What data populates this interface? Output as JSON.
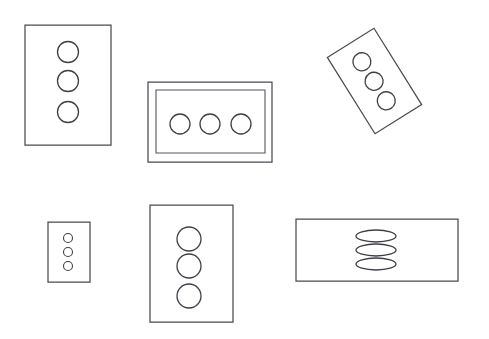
{
  "figure": {
    "background_color": "#ffffff",
    "stroke_color": "#4a4a52",
    "width": 489,
    "height": 339,
    "shape_count": 6,
    "marker_total": 18
  },
  "shapes": [
    {
      "id": "card-top-left",
      "name": "upright-rectangle-three-circles",
      "type": "rectangle",
      "orientation": "portrait",
      "rotation_deg": 0,
      "x": 25,
      "y": 25,
      "width": 86,
      "height": 120,
      "nested": false,
      "markers": {
        "shape": "circle",
        "count": 3,
        "arrangement": "vertical",
        "radius": 10.5,
        "positions": [
          {
            "cx": 68,
            "cy": 52
          },
          {
            "cx": 68,
            "cy": 81
          },
          {
            "cx": 68,
            "cy": 112
          }
        ]
      }
    },
    {
      "id": "card-top-center",
      "name": "nested-rectangle-three-circles",
      "type": "rectangle",
      "orientation": "landscape",
      "rotation_deg": 0,
      "x": 148,
      "y": 82,
      "width": 124,
      "height": 80,
      "nested": true,
      "inner": {
        "x": 156,
        "y": 90,
        "width": 109,
        "height": 63
      },
      "markers": {
        "shape": "circle",
        "count": 3,
        "arrangement": "horizontal",
        "radius": 10,
        "positions": [
          {
            "cx": 180,
            "cy": 124
          },
          {
            "cx": 210,
            "cy": 124
          },
          {
            "cx": 241,
            "cy": 124
          }
        ]
      }
    },
    {
      "id": "card-top-right",
      "name": "rotated-rectangle-three-circles",
      "type": "rectangle",
      "orientation": "portrait",
      "rotation_deg": -32,
      "x": 347,
      "y": 36,
      "width": 55,
      "height": 90,
      "nested": false,
      "markers": {
        "shape": "circle",
        "count": 3,
        "arrangement": "vertical",
        "radius": 9,
        "positions": [
          {
            "cx": 374,
            "cy": 58
          },
          {
            "cx": 374,
            "cy": 81
          },
          {
            "cx": 374,
            "cy": 104
          }
        ]
      }
    },
    {
      "id": "card-bottom-left",
      "name": "small-rectangle-three-circles",
      "type": "rectangle",
      "orientation": "portrait",
      "rotation_deg": 0,
      "x": 48,
      "y": 222,
      "width": 42,
      "height": 60,
      "nested": false,
      "markers": {
        "shape": "circle",
        "count": 3,
        "arrangement": "vertical",
        "radius": 4.5,
        "positions": [
          {
            "cx": 68,
            "cy": 238
          },
          {
            "cx": 68,
            "cy": 252
          },
          {
            "cx": 68,
            "cy": 266
          }
        ]
      }
    },
    {
      "id": "card-bottom-center",
      "name": "tall-rectangle-three-circles",
      "type": "rectangle",
      "orientation": "portrait",
      "rotation_deg": 0,
      "x": 150,
      "y": 205,
      "width": 83,
      "height": 117,
      "nested": false,
      "markers": {
        "shape": "circle",
        "count": 3,
        "arrangement": "vertical",
        "radius": 12,
        "positions": [
          {
            "cx": 189,
            "cy": 239
          },
          {
            "cx": 189,
            "cy": 266
          },
          {
            "cx": 189,
            "cy": 296
          }
        ]
      }
    },
    {
      "id": "card-bottom-right",
      "name": "wide-rectangle-three-ellipses",
      "type": "rectangle",
      "orientation": "landscape",
      "rotation_deg": 0,
      "x": 296,
      "y": 219,
      "width": 162,
      "height": 62,
      "nested": false,
      "markers": {
        "shape": "ellipse",
        "count": 3,
        "arrangement": "vertical",
        "rx": 20,
        "ry": 6,
        "positions": [
          {
            "cx": 376,
            "cy": 236
          },
          {
            "cx": 376,
            "cy": 250
          },
          {
            "cx": 376,
            "cy": 264
          }
        ]
      }
    }
  ]
}
